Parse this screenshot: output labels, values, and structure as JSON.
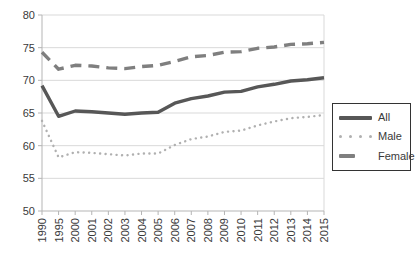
{
  "chart_data": {
    "type": "line",
    "title": "",
    "xlabel": "",
    "ylabel": "",
    "x": [
      "1990",
      "1995",
      "2000",
      "2001",
      "2002",
      "2003",
      "2004",
      "2005",
      "2006",
      "2007",
      "2008",
      "2009",
      "2010",
      "2011",
      "2012",
      "2013",
      "2014",
      "2015"
    ],
    "series": [
      {
        "name": "All",
        "style": "solid",
        "color": "#575757",
        "values": [
          69.2,
          64.5,
          65.3,
          65.2,
          65.0,
          64.8,
          65.0,
          65.1,
          66.5,
          67.2,
          67.6,
          68.2,
          68.3,
          69.0,
          69.4,
          69.9,
          70.1,
          70.4
        ]
      },
      {
        "name": "Male",
        "style": "dotted",
        "color": "#b0b0b0",
        "values": [
          63.8,
          58.2,
          59.0,
          58.9,
          58.7,
          58.5,
          58.8,
          58.8,
          60.1,
          61.0,
          61.4,
          62.1,
          62.3,
          63.1,
          63.7,
          64.2,
          64.4,
          64.7
        ]
      },
      {
        "name": "Female",
        "style": "dashed",
        "color": "#7f7f7f",
        "values": [
          74.3,
          71.7,
          72.3,
          72.2,
          71.9,
          71.8,
          72.1,
          72.3,
          72.9,
          73.6,
          73.8,
          74.3,
          74.4,
          74.9,
          75.1,
          75.5,
          75.6,
          75.8
        ]
      }
    ],
    "ylim": [
      50,
      80
    ],
    "yticks": [
      50,
      55,
      60,
      65,
      70,
      75,
      80
    ],
    "grid": "horizontal",
    "legend_position": "middle-right"
  },
  "colors": {
    "gridline": "#d9d9d9",
    "axis": "#b5b5b5",
    "tick_label": "#3a3a3a",
    "legend_border": "#333333",
    "background": "#ffffff"
  }
}
